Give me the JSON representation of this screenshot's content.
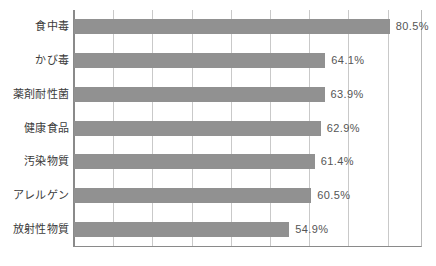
{
  "chart_data": {
    "type": "bar",
    "orientation": "horizontal",
    "title": "",
    "subtitle": "",
    "xlabel": "",
    "ylabel": "",
    "categories": [
      "食中毒",
      "かび毒",
      "薬剤耐性菌",
      "健康食品",
      "汚染物質",
      "アレルゲン",
      "放射性物質"
    ],
    "values": [
      80.5,
      64.1,
      63.9,
      62.9,
      61.4,
      60.5,
      54.9
    ],
    "value_labels": [
      "80.5%",
      "64.1%",
      "63.9%",
      "62.9%",
      "61.4%",
      "60.5%",
      "54.9%"
    ],
    "xlim": [
      0,
      89
    ],
    "xticks": [
      0,
      10,
      20,
      30,
      40,
      50,
      60,
      70,
      80
    ],
    "xtick_labels": [],
    "grid": true,
    "legend": false,
    "series": [
      {
        "name": "",
        "values": [
          80.5,
          64.1,
          63.9,
          62.9,
          61.4,
          60.5,
          54.9
        ]
      }
    ]
  },
  "colors": {
    "bar": "#919191",
    "gridline": "#c9c9c9",
    "axis": "#8a8a8a",
    "frame_right": "#b9b9b9",
    "label_text": "#3b3b3b",
    "value_text": "#555555",
    "background": "#ffffff"
  }
}
